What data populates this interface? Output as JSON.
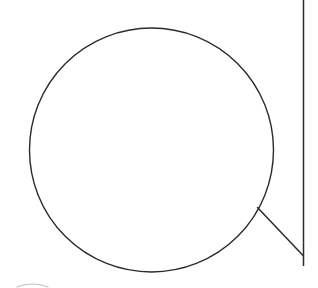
{
  "canvas": {
    "width": 318,
    "height": 288,
    "background_color": "#ffffff",
    "title": "Line Drawing"
  },
  "drawing": {
    "stroke_color": "#2b2b2e",
    "faint_stroke_color": "#8a8a8f",
    "shapes": {
      "main_circle": {
        "label": "main-circle",
        "cx": 151.5,
        "cy": 150.0,
        "r": 122.0,
        "stroke_width": 1.4,
        "fill": "none"
      },
      "right_vertical_line": {
        "label": "right-vertical-line",
        "x1": 303.5,
        "y1": 0,
        "x2": 303.5,
        "y2": 266,
        "stroke_width": 1.5
      },
      "diagonal_connector_line": {
        "label": "diagonal-connector-line",
        "x1": 257.5,
        "y1": 207.5,
        "x2": 303.5,
        "y2": 256.0,
        "stroke_width": 1.5
      },
      "bottom_left_arc": {
        "label": "bottom-left-arc",
        "path": "M 17 287 Q 32 281 48 287",
        "stroke_width": 1.2,
        "opacity": 0.55
      }
    }
  }
}
